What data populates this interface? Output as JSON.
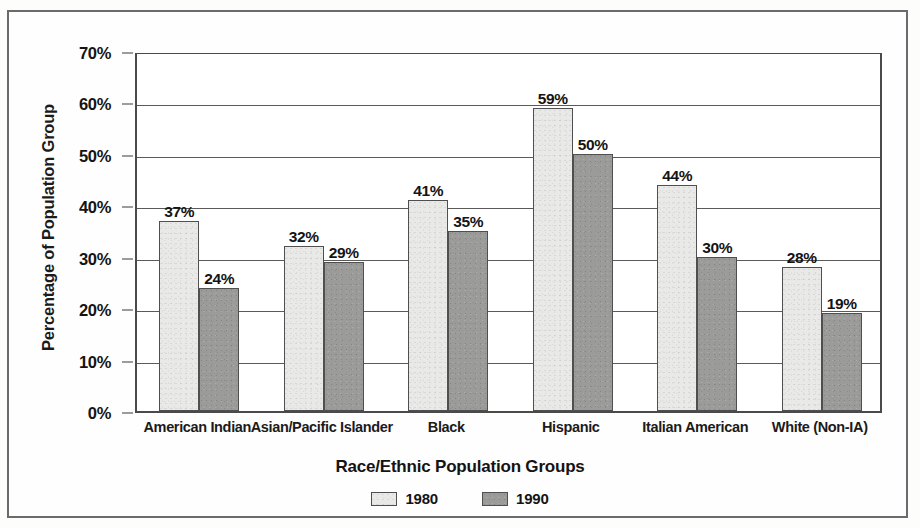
{
  "chart_data": {
    "type": "bar",
    "title": "",
    "xlabel": "Race/Ethnic Population Groups",
    "ylabel": "Percentage of Population Group",
    "categories": [
      "American Indian",
      "Asian/Pacific Islander",
      "Black",
      "Hispanic",
      "Italian American",
      "White (Non-IA)"
    ],
    "series": [
      {
        "name": "1980",
        "values": [
          37,
          32,
          41,
          59,
          44,
          28
        ],
        "color": "#e9e9e7"
      },
      {
        "name": "1990",
        "values": [
          24,
          29,
          35,
          50,
          30,
          19
        ],
        "color": "#9b9b99"
      }
    ],
    "value_labels": [
      [
        "37%",
        "32%",
        "41%",
        "59%",
        "44%",
        "28%"
      ],
      [
        "24%",
        "29%",
        "35%",
        "50%",
        "30%",
        "19%"
      ]
    ],
    "ylim": [
      0,
      70
    ],
    "ytick_values": [
      0,
      10,
      20,
      30,
      40,
      50,
      60,
      70
    ],
    "ytick_labels": [
      "0%",
      "10%",
      "20%",
      "30%",
      "40%",
      "50%",
      "60%",
      "70%"
    ],
    "grid": "horizontal",
    "legend_position": "bottom-center",
    "legend_entries": [
      "1980",
      "1990"
    ]
  },
  "figure": {
    "frame_color": "#6b6b6b",
    "axis_color": "#4a4a4a",
    "text_color": "#141414",
    "background": "#fefefe"
  }
}
